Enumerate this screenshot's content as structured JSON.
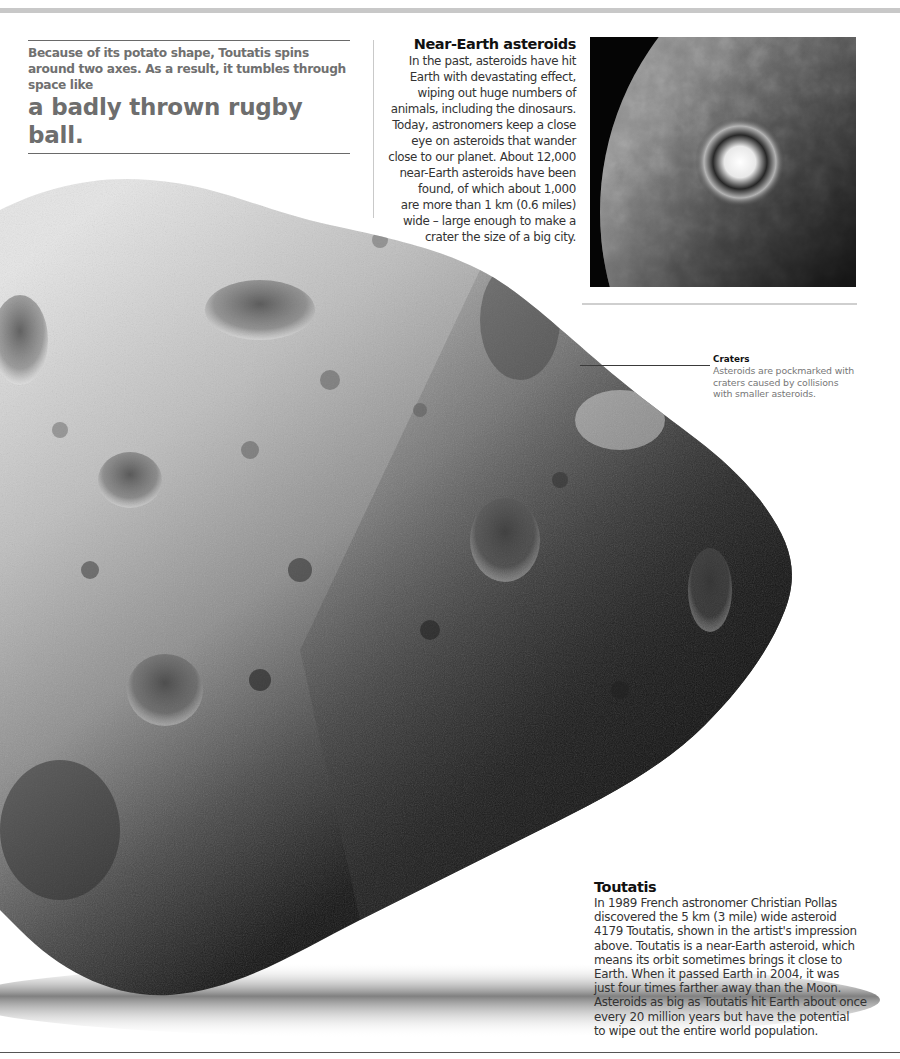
{
  "intro": {
    "lead": "Because of its potato shape, Toutatis spins around two axes. As a result, it tumbles through space like",
    "emphasis": "a badly thrown rugby ball."
  },
  "near_earth": {
    "title": "Near-Earth asteroids",
    "lines": [
      "In the past, asteroids have hit",
      "Earth with devastating effect,",
      "wiping out huge numbers of",
      "animals, including the dinosaurs.",
      "Today, astronomers keep a close",
      "eye on asteroids that wander",
      "close to our planet. About 12,000",
      "near-Earth asteroids have been",
      "found, of which about 1,000",
      "are more than 1 km (0.6 miles)",
      "wide – large enough to make a",
      "crater the size of a big city."
    ],
    "image": "earth-impact-illustration"
  },
  "craters_label": {
    "title": "Craters",
    "lines": [
      "Asteroids are pockmarked with",
      "craters caused by collisions",
      "with smaller asteroids."
    ]
  },
  "toutatis": {
    "title": "Toutatis",
    "lines": [
      "In 1989 French astronomer Christian Pollas",
      "discovered the 5 km (3 mile) wide asteroid",
      "4179 Toutatis, shown in the artist's impression",
      "above. Toutatis is a near-Earth asteroid, which",
      "means its orbit sometimes brings it close to",
      "Earth. When it passed Earth in 2004, it was",
      "just four times farther away than the Moon.",
      "Asteroids as big as Toutatis hit Earth about once",
      "every 20 million years but have the potential",
      "to wipe out the entire world population."
    ]
  },
  "main_image": "asteroid-toutatis-illustration"
}
